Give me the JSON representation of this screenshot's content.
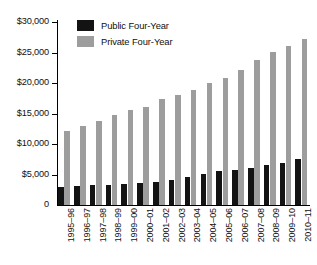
{
  "chart_data": {
    "type": "bar",
    "title": "",
    "subtitle": "",
    "xlabel": "",
    "ylabel": "",
    "ylim": [
      0,
      30000
    ],
    "ytick_labels": [
      "$30,000",
      "$25,000",
      "$20,000",
      "$15,000",
      "$10,000",
      "$5,000",
      "0"
    ],
    "ytick_values": [
      30000,
      25000,
      20000,
      15000,
      10000,
      5000,
      0
    ],
    "grid": false,
    "legend_position": "top-left",
    "categories": [
      "1995–96",
      "1996–97",
      "1997–98",
      "1998–99",
      "1999–00",
      "2000–01",
      "2001–02",
      "2002–03",
      "2003–04",
      "2004–05",
      "2005–06",
      "2006–07",
      "2007–08",
      "2008–09",
      "2009–10",
      "2010–11"
    ],
    "series": [
      {
        "name": "Public Four-Year",
        "color": "#131313",
        "values": [
          2900,
          3050,
          3200,
          3350,
          3450,
          3550,
          3800,
          4100,
          4650,
          5100,
          5500,
          5800,
          6150,
          6550,
          6950,
          7600
        ]
      },
      {
        "name": "Private Four-Year",
        "color": "#9d9d9d",
        "values": [
          12200,
          13000,
          13800,
          14700,
          15500,
          16000,
          17300,
          18000,
          18900,
          20000,
          20900,
          22200,
          23700,
          25100,
          26100,
          27200
        ]
      }
    ]
  },
  "legend": {
    "items": [
      {
        "label": "Public Four-Year",
        "color": "#131313"
      },
      {
        "label": "Private Four-Year",
        "color": "#9d9d9d"
      }
    ]
  }
}
